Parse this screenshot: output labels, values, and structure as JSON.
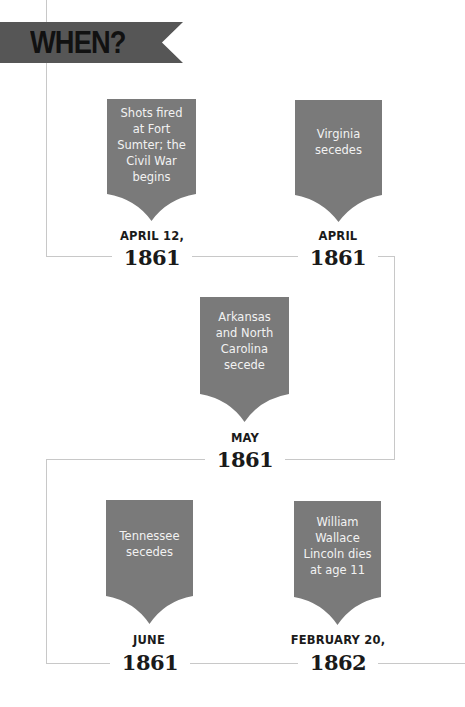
{
  "header": {
    "title": "WHEN?"
  },
  "colors": {
    "banner": "#565656",
    "card": "#7a7a7a",
    "line": "#c8c8c8",
    "text_dark": "#1a1a1a"
  },
  "events": [
    {
      "text_lines": [
        "Shots fired",
        "at Fort",
        "Sumter; the",
        "Civil War",
        "begins"
      ],
      "date": "APRIL 12,",
      "year": "1861"
    },
    {
      "text_lines": [
        "Virginia",
        "secedes"
      ],
      "date": "APRIL",
      "year": "1861"
    },
    {
      "text_lines": [
        "Arkansas",
        "and North",
        "Carolina",
        "secede"
      ],
      "date": "MAY",
      "year": "1861"
    },
    {
      "text_lines": [
        "Tennessee",
        "secedes"
      ],
      "date": "JUNE",
      "year": "1861"
    },
    {
      "text_lines": [
        "William",
        "Wallace",
        "Lincoln dies",
        "at age 11"
      ],
      "date": "FEBRUARY 20,",
      "year": "1862"
    }
  ]
}
